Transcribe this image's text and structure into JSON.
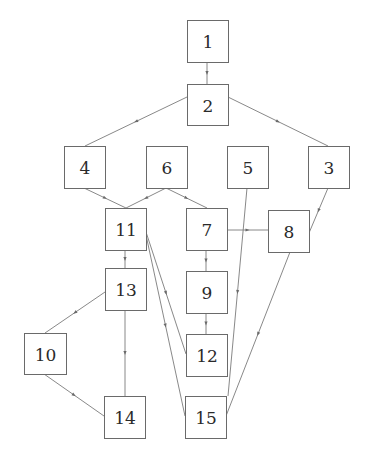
{
  "diagram": {
    "type": "directed-graph",
    "nodes": [
      {
        "id": "1",
        "label": "1",
        "x": 187,
        "y": 20,
        "w": 41,
        "h": 42
      },
      {
        "id": "2",
        "label": "2",
        "x": 187,
        "y": 84,
        "w": 41,
        "h": 41
      },
      {
        "id": "4",
        "label": "4",
        "x": 64,
        "y": 146,
        "w": 41,
        "h": 42
      },
      {
        "id": "6",
        "label": "6",
        "x": 146,
        "y": 146,
        "w": 41,
        "h": 42
      },
      {
        "id": "5",
        "label": "5",
        "x": 227,
        "y": 146,
        "w": 41,
        "h": 42
      },
      {
        "id": "3",
        "label": "3",
        "x": 308,
        "y": 146,
        "w": 41,
        "h": 42
      },
      {
        "id": "11",
        "label": "11",
        "x": 105,
        "y": 208,
        "w": 41,
        "h": 42
      },
      {
        "id": "7",
        "label": "7",
        "x": 186,
        "y": 208,
        "w": 41,
        "h": 42
      },
      {
        "id": "8",
        "label": "8",
        "x": 268,
        "y": 210,
        "w": 41,
        "h": 42
      },
      {
        "id": "13",
        "label": "13",
        "x": 105,
        "y": 268,
        "w": 41,
        "h": 42
      },
      {
        "id": "9",
        "label": "9",
        "x": 186,
        "y": 271,
        "w": 41,
        "h": 42
      },
      {
        "id": "10",
        "label": "10",
        "x": 24,
        "y": 333,
        "w": 42,
        "h": 41
      },
      {
        "id": "12",
        "label": "12",
        "x": 186,
        "y": 334,
        "w": 41,
        "h": 42
      },
      {
        "id": "14",
        "label": "14",
        "x": 104,
        "y": 396,
        "w": 41,
        "h": 42
      },
      {
        "id": "15",
        "label": "15",
        "x": 185,
        "y": 396,
        "w": 41,
        "h": 42
      }
    ],
    "edges": [
      {
        "from": "1",
        "to": "2",
        "x1": 207,
        "y1": 62,
        "x2": 207,
        "y2": 84
      },
      {
        "from": "2",
        "to": "4",
        "x1": 187,
        "y1": 97,
        "x2": 85,
        "y2": 146
      },
      {
        "from": "2",
        "to": "3",
        "x1": 228,
        "y1": 97,
        "x2": 328,
        "y2": 146
      },
      {
        "from": "4",
        "to": "11",
        "x1": 84,
        "y1": 188,
        "x2": 126,
        "y2": 208
      },
      {
        "from": "6",
        "to": "11",
        "x1": 166,
        "y1": 188,
        "x2": 126,
        "y2": 208
      },
      {
        "from": "6",
        "to": "7",
        "x1": 166,
        "y1": 188,
        "x2": 207,
        "y2": 208
      },
      {
        "from": "7",
        "to": "8",
        "x1": 227,
        "y1": 230,
        "x2": 268,
        "y2": 230
      },
      {
        "from": "3",
        "to": "8",
        "x1": 328,
        "y1": 188,
        "x2": 309,
        "y2": 233
      },
      {
        "from": "11",
        "to": "13",
        "x1": 125,
        "y1": 250,
        "x2": 125,
        "y2": 268
      },
      {
        "from": "7",
        "to": "9",
        "x1": 206,
        "y1": 250,
        "x2": 206,
        "y2": 271
      },
      {
        "from": "9",
        "to": "12",
        "x1": 206,
        "y1": 313,
        "x2": 206,
        "y2": 334
      },
      {
        "from": "11",
        "to": "12",
        "x1": 146,
        "y1": 232,
        "x2": 186,
        "y2": 354
      },
      {
        "from": "11",
        "to": "15",
        "x1": 146,
        "y1": 235,
        "x2": 185,
        "y2": 416
      },
      {
        "from": "5",
        "to": "15",
        "x1": 247,
        "y1": 188,
        "x2": 228,
        "y2": 396
      },
      {
        "from": "8",
        "to": "15",
        "x1": 290,
        "y1": 252,
        "x2": 226,
        "y2": 416
      },
      {
        "from": "13",
        "to": "10",
        "x1": 105,
        "y1": 292,
        "x2": 45,
        "y2": 333
      },
      {
        "from": "13",
        "to": "14",
        "x1": 125,
        "y1": 310,
        "x2": 125,
        "y2": 396
      },
      {
        "from": "10",
        "to": "14",
        "x1": 44,
        "y1": 374,
        "x2": 104,
        "y2": 416
      }
    ]
  }
}
